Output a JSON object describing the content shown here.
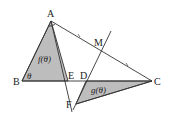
{
  "diagram": {
    "type": "geometry",
    "points": {
      "A": {
        "label": "A",
        "x": 51,
        "y": 21
      },
      "B": {
        "label": "B",
        "x": 22,
        "y": 81
      },
      "C": {
        "label": "C",
        "x": 152,
        "y": 81
      },
      "D": {
        "label": "D",
        "x": 86,
        "y": 81
      },
      "E": {
        "label": "E",
        "x": 68,
        "y": 81
      },
      "F": {
        "label": "F",
        "x": 76,
        "y": 104
      },
      "M": {
        "label": "M",
        "x": 101,
        "y": 51
      }
    },
    "regions": [
      {
        "name": "triangle-ABE",
        "label": "f(θ)",
        "color": "#bdbdbd"
      },
      {
        "name": "triangle-FDC",
        "label": "g(θ)",
        "color": "#bdbdbd"
      }
    ],
    "angle_label": "θ",
    "notes": {
      "equal_marks": "AM = MC (tick marks on AC)",
      "lines": [
        "AB",
        "BC",
        "AC",
        "AF (through E)",
        "FM line (through D)",
        "FC"
      ]
    }
  }
}
